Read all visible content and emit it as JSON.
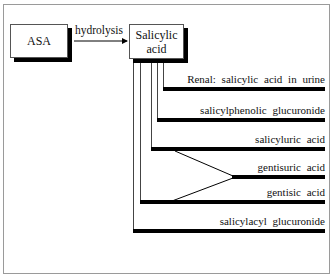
{
  "diagram": {
    "source": {
      "label": "ASA"
    },
    "process": {
      "label": "hydrolysis"
    },
    "product": {
      "line1": "Salicylic",
      "line2": "acid"
    },
    "pathways": [
      {
        "label": "Renal:  salicylic  acid  in  urine"
      },
      {
        "label": "salicylphenolic  glucuronide"
      },
      {
        "label": "salicyluric  acid"
      },
      {
        "label": "gentisuric  acid"
      },
      {
        "label": "gentisic  acid"
      },
      {
        "label": "salicylacyl  glucuronide"
      }
    ]
  }
}
